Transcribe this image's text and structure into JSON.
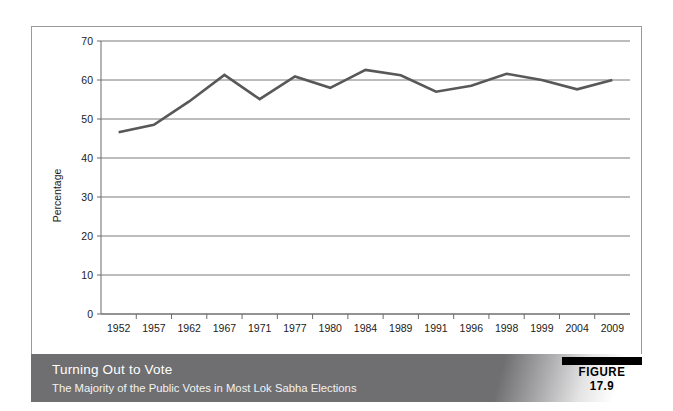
{
  "figure": {
    "badge_label": "FIGURE 17.9",
    "caption_title": "Turning Out to Vote",
    "caption_subtitle": "The Majority of the Public Votes in Most Lok Sabha Elections"
  },
  "colors": {
    "line": "#58585a",
    "grid": "#6b6b6b",
    "caption_bar": "#6f6f71",
    "badge_bar": "#000000",
    "background": "#ffffff"
  },
  "chart_data": {
    "type": "line",
    "title": "Turning Out to Vote",
    "subtitle": "The Majority of the Public Votes in Most Lok Sabha Elections",
    "xlabel": "Year",
    "ylabel": "Percentage",
    "ylim": [
      0,
      70
    ],
    "ytick_step": 10,
    "yticks": [
      0,
      10,
      20,
      30,
      40,
      50,
      60,
      70
    ],
    "grid": true,
    "grid_axis": "y",
    "legend": false,
    "categories": [
      "1952",
      "1957",
      "1962",
      "1967",
      "1971",
      "1977",
      "1980",
      "1984",
      "1989",
      "1991",
      "1996",
      "1998",
      "1999",
      "2004",
      "2009"
    ],
    "values": [
      46.6,
      48.5,
      54.5,
      61.3,
      55.1,
      60.9,
      58.0,
      62.6,
      61.2,
      57.0,
      58.5,
      61.6,
      60.0,
      57.6,
      60.0
    ],
    "series": [
      {
        "name": "Voter turnout",
        "values": [
          46.6,
          48.5,
          54.5,
          61.3,
          55.1,
          60.9,
          58.0,
          62.6,
          61.2,
          57.0,
          58.5,
          61.6,
          60.0,
          57.6,
          60.0
        ]
      }
    ]
  }
}
